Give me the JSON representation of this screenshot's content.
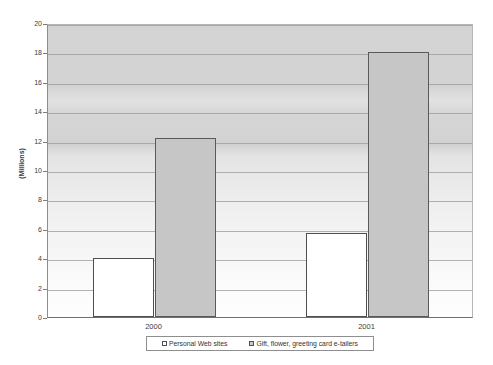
{
  "chart_data": {
    "type": "bar",
    "title": "",
    "xlabel": "",
    "ylabel": "(Millions)",
    "categories": [
      "2000",
      "2001"
    ],
    "series": [
      {
        "name": "Personal Web sites",
        "values": [
          4.0,
          5.7
        ],
        "color": "#ffffff"
      },
      {
        "name": "Gift, flower, greeting card e-tailers",
        "values": [
          12.2,
          18.0
        ],
        "color": "#c6c6c6"
      }
    ],
    "ylim": [
      0,
      20
    ],
    "ytick_step": 2,
    "yticks": [
      "0",
      "2",
      "4",
      "6",
      "8",
      "10",
      "12",
      "14",
      "16",
      "18",
      "20"
    ],
    "grid": true,
    "legend_position": "bottom"
  },
  "axis": {
    "y_title": "(Millions)"
  },
  "legend": {
    "entries": [
      {
        "label": "Personal Web sites"
      },
      {
        "label": "Gift, flower, greeting card e-tailers"
      }
    ]
  }
}
